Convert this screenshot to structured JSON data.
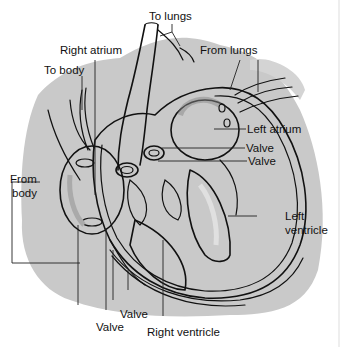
{
  "diagram": {
    "labels": {
      "to_lungs": "To lungs",
      "right_atrium": "Right atrium",
      "to_body": "To body",
      "from_lungs": "From lungs",
      "from_body_line1": "From",
      "from_body_line2": "body",
      "left_atrium": "Left atrium",
      "valve_upper": "Valve",
      "valve_lower": "Valve",
      "left_ventricle_line1": "Left",
      "left_ventricle_line2": "ventricle",
      "valve_bottom_right": "Valve",
      "valve_bottom_left": "Valve",
      "right_ventricle": "Right ventricle"
    },
    "colors": {
      "background": "#ffffff",
      "shadow": "#c8c8c8",
      "chamber_shade": "#9a9a9a",
      "ink": "#111111"
    }
  }
}
